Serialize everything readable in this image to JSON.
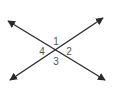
{
  "diagram": {
    "type": "intersecting-lines",
    "colors": {
      "line": "#2a2a2a",
      "label": "#555555",
      "background": "#ffffff"
    },
    "intersection": {
      "x": 56,
      "y": 50
    },
    "lines": [
      {
        "name": "line-a",
        "from": {
          "x": 8,
          "y": 21
        },
        "to": {
          "x": 105,
          "y": 80
        },
        "arrows": "both"
      },
      {
        "name": "line-b",
        "from": {
          "x": 10,
          "y": 80
        },
        "to": {
          "x": 103,
          "y": 18
        },
        "arrows": "both"
      }
    ],
    "angles": [
      {
        "label": "1",
        "position": "top",
        "x": 56,
        "y": 45
      },
      {
        "label": "2",
        "position": "right",
        "x": 69,
        "y": 55
      },
      {
        "label": "3",
        "position": "bottom",
        "x": 56,
        "y": 65
      },
      {
        "label": "4",
        "position": "left",
        "x": 42,
        "y": 55
      }
    ]
  }
}
